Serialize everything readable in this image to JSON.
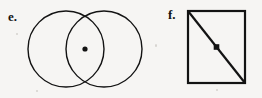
{
  "page": {
    "background_color": "#f6f5f3",
    "ink_color": "#131313"
  },
  "figures": [
    {
      "id": "e",
      "label": "e.",
      "shape_name": "two-overlapping-circles",
      "marker": "center-dot",
      "geometry": {
        "circles": [
          {
            "cx": 66,
            "cy": 49,
            "r": 38
          },
          {
            "cx": 104,
            "cy": 49,
            "r": 38
          }
        ],
        "dot": {
          "cx": 85,
          "cy": 49,
          "r": 2.6
        },
        "stroke_width": 1.4
      }
    },
    {
      "id": "f",
      "label": "f.",
      "shape_name": "square-with-diagonal",
      "marker": "center-dot",
      "geometry": {
        "square": {
          "x": 188,
          "y": 11,
          "width": 57,
          "height": 72
        },
        "diagonal": {
          "x1": 188,
          "y1": 11,
          "x2": 245,
          "y2": 83
        },
        "dot": {
          "cx": 216.5,
          "cy": 47,
          "r": 2.8
        },
        "stroke_width": 2.2
      }
    }
  ]
}
